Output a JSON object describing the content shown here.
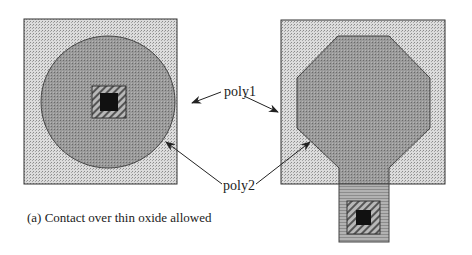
{
  "diagram": {
    "labels": {
      "poly1": "poly1",
      "poly2": "poly2"
    },
    "caption": "(a) Contact over thin oxide allowed",
    "colors": {
      "background": "#ffffff",
      "field": "#c8c8c8",
      "poly": "#8c8c8c",
      "stem": "#a8a8a8",
      "contact_hatch": "#7a7a7a",
      "contact_core": "#111111",
      "outline": "#333333"
    },
    "left_structure": {
      "outer_square": "active-region",
      "shape": "circle",
      "contact": "contact-over-thin-oxide"
    },
    "right_structure": {
      "outer_square": "active-region",
      "shape": "octagon-with-stem",
      "contact": "contact-on-extension"
    }
  }
}
